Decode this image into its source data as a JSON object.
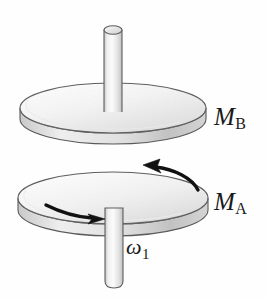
{
  "figure": {
    "caption_labels": {
      "disc_upper": {
        "symbol": "M",
        "subscript": "B",
        "full": "M_B"
      },
      "disc_lower": {
        "symbol": "M",
        "subscript": "A",
        "full": "M_A"
      },
      "angular_velocity": {
        "symbol": "ω",
        "subscript": "1",
        "full": "ω₁"
      }
    },
    "colors": {
      "background": "#fefefe",
      "outline": "#4a4a4a",
      "disc_top_face_light": "#fdfdfd",
      "disc_top_face_dark": "#d8d8d8",
      "disc_rim_light": "#e8e8e8",
      "disc_rim_dark": "#b4b4b4",
      "shaft_light": "#fbfbfb",
      "shaft_mid": "#e2e2e2",
      "shaft_dark": "#bcbcbc",
      "arrow": "#111111",
      "label_text": "#1a1a1a"
    },
    "geometry": {
      "upper_disc": {
        "cx": 113,
        "cy": 108,
        "rx": 93,
        "ry": 25,
        "thickness": 11
      },
      "lower_disc": {
        "cx": 113,
        "cy": 198,
        "rx": 95,
        "ry": 26,
        "thickness": 12
      },
      "upper_shaft": {
        "x": 104,
        "y_top": 26,
        "width": 18,
        "y_bottom": 112
      },
      "lower_shaft": {
        "x": 105,
        "y_top": 205,
        "width": 18,
        "y_bottom": 288
      }
    },
    "arrows": {
      "back_arrow": {
        "name": "rotation-arrow-back",
        "direction": "leftward along back rim",
        "head_at": [
          150,
          168
        ]
      },
      "front_arrow": {
        "name": "rotation-arrow-front",
        "direction": "rightward along front rim",
        "head_at": [
          103,
          219
        ]
      }
    }
  }
}
